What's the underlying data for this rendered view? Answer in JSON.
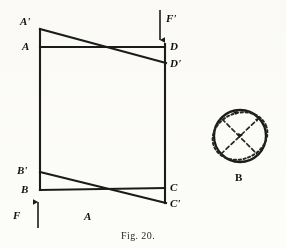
{
  "figure": {
    "caption": "Fig. 20.",
    "left_diagram_label": "A",
    "right_diagram_label": "B"
  },
  "vertices": {
    "a_prime": {
      "label": "A'",
      "x": 40,
      "y": 29
    },
    "a": {
      "label": "A",
      "x": 40,
      "y": 47
    },
    "d": {
      "label": "D",
      "x": 165,
      "y": 47
    },
    "d_prime": {
      "label": "D'",
      "x": 165,
      "y": 63
    },
    "b_prime": {
      "label": "B'",
      "x": 40,
      "y": 172
    },
    "b": {
      "label": "B",
      "x": 40,
      "y": 190
    },
    "c": {
      "label": "C",
      "x": 165,
      "y": 188
    },
    "c_prime": {
      "label": "C'",
      "x": 165,
      "y": 203
    }
  },
  "vertex_labels": [
    {
      "name": "a-prime",
      "text": "A'",
      "left": 20,
      "top": 16
    },
    {
      "name": "a",
      "text": "A",
      "left": 22,
      "top": 41
    },
    {
      "name": "d",
      "text": "D",
      "left": 170,
      "top": 41
    },
    {
      "name": "d-prime",
      "text": "D'",
      "left": 170,
      "top": 59
    },
    {
      "name": "b-prime",
      "text": "B'",
      "left": 18,
      "top": 165
    },
    {
      "name": "b",
      "text": "B",
      "left": 22,
      "top": 185
    },
    {
      "name": "c",
      "text": "C",
      "left": 170,
      "top": 183
    },
    {
      "name": "c-prime",
      "text": "C'",
      "left": 170,
      "top": 199
    }
  ],
  "forces": [
    {
      "name": "force-f-prime",
      "label": "F'",
      "direction": "down",
      "x": 160,
      "y_start": 10,
      "y_end": 44,
      "label_left": 166,
      "label_top": 14
    },
    {
      "name": "force-f",
      "label": "F",
      "direction": "up",
      "x": 38,
      "y_start": 228,
      "y_end": 198,
      "label_left": 14,
      "label_top": 211
    }
  ],
  "region_labels": [
    {
      "name": "diagram-a-label",
      "text": "A",
      "left": 84,
      "top": 212
    },
    {
      "name": "diagram-b-label",
      "text": "B",
      "left": 236,
      "top": 172
    }
  ],
  "caption": {
    "text": "Fig. 20.",
    "left": 122,
    "top": 230
  },
  "circle_diagram": {
    "center_x": 240,
    "center_y": 136,
    "radius": 26,
    "ellipse_rx": 28,
    "ellipse_ry": 23,
    "ellipse_rotation_deg": -22
  },
  "colors": {
    "ink": "#1b1b1b",
    "paper": "#fdfdfb",
    "dotted_ink": "#262626"
  }
}
